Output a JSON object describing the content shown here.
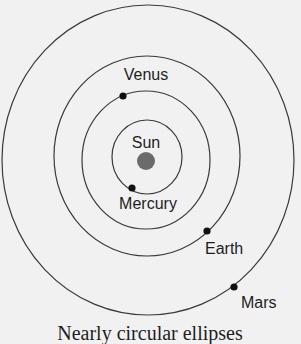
{
  "diagram": {
    "caption": "Nearly circular ellipses",
    "sun": {
      "label": "Sun",
      "color": "#6b6b6b"
    },
    "planets": [
      {
        "name": "Mercury",
        "label": "Mercury"
      },
      {
        "name": "Venus",
        "label": "Venus"
      },
      {
        "name": "Earth",
        "label": "Earth"
      },
      {
        "name": "Mars",
        "label": "Mars"
      }
    ],
    "colors": {
      "background": "#f1f1f1",
      "orbit": "#3a3a3a",
      "planet": "#111111",
      "text": "#1e1e1e"
    }
  }
}
